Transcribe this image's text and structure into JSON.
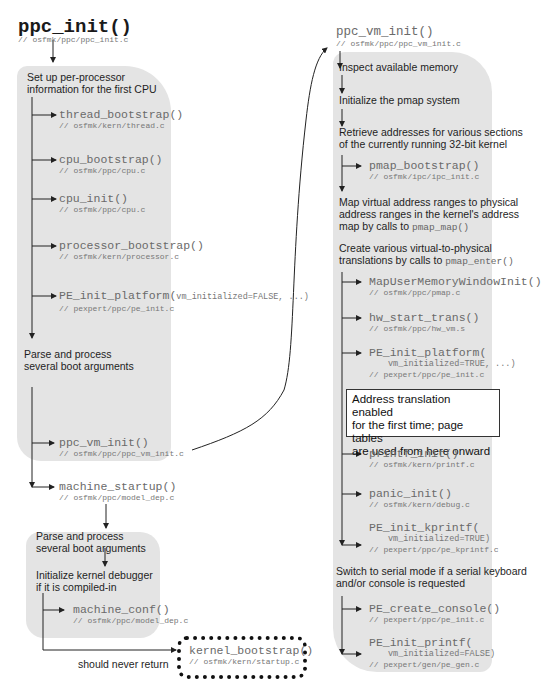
{
  "left_column": {
    "title": "ppc_init()",
    "title_path": "// osfmk/ppc/ppc_init.c",
    "step1": [
      "Set up per-processor",
      "information for the first CPU"
    ],
    "calls1": [
      {
        "name": "thread_bootstrap()",
        "path": "// osfmk/kern/thread.c"
      },
      {
        "name": "cpu_bootstrap()",
        "path": "// osfmk/ppc/cpu.c"
      },
      {
        "name": "cpu_init()",
        "path": "// osfmk/ppc/cpu.c"
      },
      {
        "name": "processor_bootstrap()",
        "path": "// osfmk/kern/processor.c"
      },
      {
        "name": "PE_init_platform(",
        "args": "vm_initialized=FALSE, ...)",
        "path": "// pexpert/ppc/pe_init.c"
      }
    ],
    "step2": [
      "Parse and process",
      "several boot arguments"
    ],
    "calls2": [
      {
        "name": "ppc_vm_init()",
        "path": "// osfmk/ppc/ppc_vm_init.c"
      },
      {
        "name": "machine_startup()",
        "path": "// osfmk/ppc/model_dep.c"
      }
    ],
    "sub": {
      "step1": [
        "Parse and process",
        "several boot arguments"
      ],
      "step2": [
        "Initialize kernel debugger",
        "if it is compiled-in"
      ],
      "call": {
        "name": "machine_conf()",
        "path": "// osfmk/ppc/model_dep.c"
      }
    },
    "never_return_label": "should never return",
    "kernel_bootstrap": {
      "name": "kernel_bootstrap()",
      "path": "// osfmk/kern/startup.c"
    }
  },
  "right_column": {
    "title": "ppc_vm_init()",
    "title_path": "// osfmk/ppc/ppc_vm_init.c",
    "steps": {
      "inspect": "Inspect available memory",
      "pmap_init": "Initialize the pmap system",
      "retrieve": [
        "Retrieve addresses for various sections",
        "of the currently running 32-bit kernel"
      ],
      "map_virtual": [
        "Map virtual address ranges to physical",
        "address ranges in the kernel's address",
        "map by calls to "
      ],
      "map_virtual_fn": "pmap_map()",
      "create_trans": [
        "Create various virtual-to-physical",
        "translations by calls to "
      ],
      "create_trans_fn": "pmap_enter()",
      "serial": [
        "Switch to serial mode if a serial keyboard",
        "and/or console is requested"
      ]
    },
    "pmap_bootstrap": {
      "name": "pmap_bootstrap()",
      "path": "// osfmk/ipc/ipc_init.c"
    },
    "calls": [
      {
        "name": "MapUserMemoryWindowInit()",
        "path": "// osfmk/ppc/pmap.c"
      },
      {
        "name": "hw_start_trans()",
        "path": "// osfmk/ppc/hw_vm.s"
      },
      {
        "name": "PE_init_platform(",
        "args": "vm_initialized=TRUE, ...)",
        "path": "// pexpert/ppc/pe_init.c"
      },
      {
        "name": "printf_init()",
        "path": "// osfmk/kern/printf.c"
      },
      {
        "name": "panic_init()",
        "path": "// osfmk/kern/debug.c"
      },
      {
        "name": "PE_init_kprintf(",
        "args": "vm_initialized=TRUE)",
        "path": "// pexpert/ppc/pe_kprintf.c"
      }
    ],
    "note": [
      "Address translation enabled",
      "for the first time; page tables",
      "are used from here onward"
    ],
    "console_calls": [
      {
        "name": "PE_create_console()",
        "path": "// pexpert/ppc/pe_init.c"
      },
      {
        "name": "PE_init_printf(",
        "args": "vm_initialized=FALSE)",
        "path": "// pexpert/gen/pe_gen.c"
      }
    ]
  },
  "colors": {
    "panel": "#e4e4e4",
    "line": "#222222",
    "function_text": "#6a6a6a"
  }
}
